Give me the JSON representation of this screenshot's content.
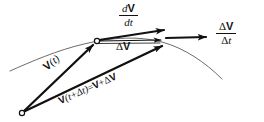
{
  "figure": {
    "background_color": "#ffffff",
    "ink_color": "#111111",
    "curve_color": "#555555",
    "labels": {
      "derivative": {
        "name": "dV/dt",
        "numerator_prefix": "d",
        "numerator_vector": "V",
        "denominator_prefix": "d",
        "denominator_var": "t"
      },
      "difference_quotient": {
        "name": "ΔV/Δt",
        "numerator_prefix": "Δ",
        "numerator_vector": "V",
        "denominator_prefix": "Δ",
        "denominator_var": "t"
      },
      "delta_v": {
        "name": "ΔV",
        "prefix": "Δ",
        "vector": "V"
      },
      "v_of_t": {
        "name": "V(t)",
        "vector": "V",
        "arg": "(t)"
      },
      "v_t_plus_delta_t": {
        "name": "V(t+Δt) = V + ΔV",
        "vector": "V",
        "arg": "(t+Δt)",
        "equals": "=",
        "rhs_vector_1": "V",
        "rhs_plus": "+",
        "rhs_delta": "Δ",
        "rhs_vector_2": "V"
      }
    },
    "elements": {
      "trajectory_curve": "trajectory-curve",
      "origin_marker": "origin-point",
      "tangent_point_marker": "tangent-point",
      "vector_v_t": "vector-v-of-t",
      "vector_v_t_plus_dt": "vector-v-t-plus-delta-t",
      "vector_delta_v": "vector-delta-v",
      "vector_dvdt": "vector-dvdt",
      "vector_delta_v_over_delta_t": "vector-delta-v-over-delta-t"
    }
  }
}
